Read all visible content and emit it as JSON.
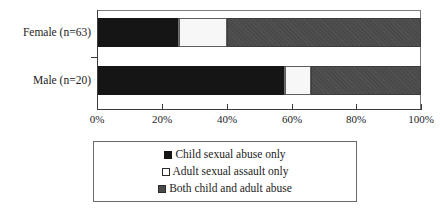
{
  "chart_data": {
    "type": "bar",
    "orientation": "horizontal",
    "stacked": true,
    "stack_mode": "percent",
    "title": "",
    "subtitle": "",
    "xlabel": "",
    "ylabel": "",
    "xlim": [
      0,
      100
    ],
    "grid": false,
    "legend_position": "bottom",
    "categories": [
      "Female (n=63)",
      "Male (n=20)"
    ],
    "x_tick_labels": [
      "0%",
      "20%",
      "40%",
      "60%",
      "80%",
      "100%"
    ],
    "x_tick_values": [
      0,
      20,
      40,
      60,
      80,
      100
    ],
    "series": [
      {
        "name": "Child sexual abuse only",
        "swatch": "black",
        "color": "#151515",
        "values": [
          25,
          58
        ]
      },
      {
        "name": "Adult sexual assault only",
        "swatch": "white",
        "color": "#ffffff",
        "values": [
          15,
          8
        ]
      },
      {
        "name": "Both child and adult abuse",
        "swatch": "gray",
        "color": "#4a4a4a",
        "values": [
          60,
          34
        ]
      }
    ],
    "annotations": []
  },
  "legend": {
    "items": [
      {
        "label": "Child sexual abuse only",
        "swatch": "black"
      },
      {
        "label": "Adult sexual assault only",
        "swatch": "white"
      },
      {
        "label": "Both child and adult abuse",
        "swatch": "gray"
      }
    ]
  },
  "axis": {
    "categories": [
      "Female (n=63)",
      "Male (n=20)"
    ],
    "ticks": [
      "0%",
      "20%",
      "40%",
      "60%",
      "80%",
      "100%"
    ]
  }
}
